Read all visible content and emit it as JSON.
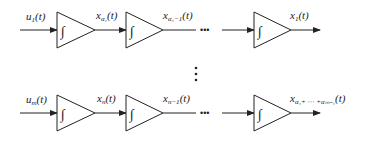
{
  "diagram": {
    "type": "integrator-chain-block-diagram",
    "block_symbol": "∫",
    "rows": [
      {
        "input": {
          "base": "u",
          "sub": "1",
          "suffix": "(t)"
        },
        "signals": [
          {
            "base": "x",
            "sub": "α₁",
            "suffix": "(t)"
          },
          {
            "base": "x",
            "sub": "α₁−1",
            "suffix": "(t)"
          },
          {
            "base": "x",
            "sub": "1",
            "suffix": "(t)"
          }
        ]
      },
      {
        "input": {
          "base": "u",
          "sub": "m",
          "suffix": "(t)"
        },
        "signals": [
          {
            "base": "x",
            "sub": "n",
            "suffix": "(t)"
          },
          {
            "base": "x",
            "sub": "n−1",
            "suffix": "(t)"
          },
          {
            "base": "x",
            "sub": "α₁+ ⋯ +αₘ₋₁",
            "suffix": "(t)"
          }
        ]
      }
    ],
    "horizontal_ellipsis": "•••",
    "vertical_ellipsis": "⋮"
  }
}
